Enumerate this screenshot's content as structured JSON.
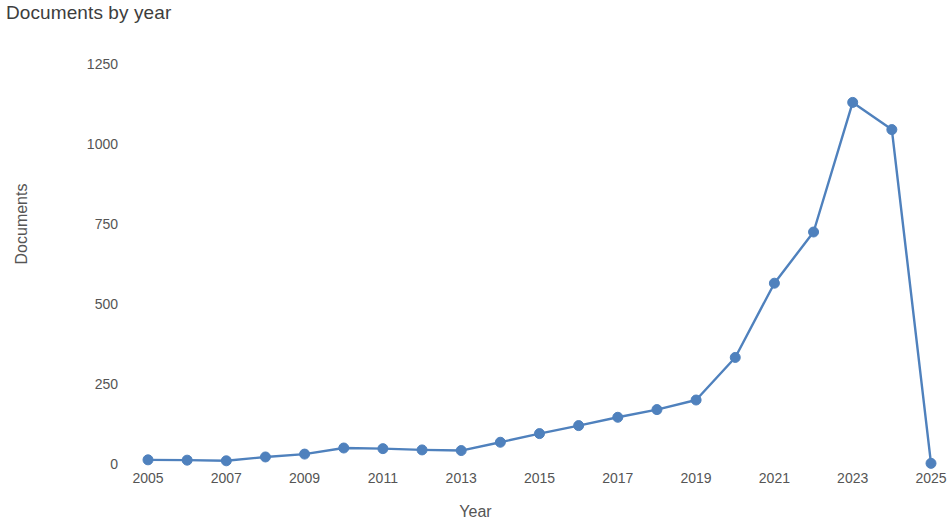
{
  "chart_data": {
    "type": "line",
    "title": "Documents by year",
    "xlabel": "Year",
    "ylabel": "Documents",
    "x": [
      2005,
      2006,
      2007,
      2008,
      2009,
      2010,
      2011,
      2012,
      2013,
      2014,
      2015,
      2016,
      2017,
      2018,
      2019,
      2020,
      2021,
      2022,
      2023,
      2024,
      2025
    ],
    "values": [
      13,
      12,
      10,
      22,
      31,
      50,
      48,
      44,
      42,
      68,
      95,
      120,
      146,
      170,
      200,
      333,
      565,
      725,
      1130,
      1045,
      2
    ],
    "series": [
      {
        "name": "Documents",
        "values": [
          13,
          12,
          10,
          22,
          31,
          50,
          48,
          44,
          42,
          68,
          95,
          120,
          146,
          170,
          200,
          333,
          565,
          725,
          1130,
          1045,
          2
        ],
        "color": "#4f81bd"
      }
    ],
    "xlim": [
      2005,
      2025
    ],
    "ylim": [
      0,
      1250
    ],
    "x_tick_labels": [
      "2005",
      "2007",
      "2009",
      "2011",
      "2013",
      "2015",
      "2017",
      "2019",
      "2021",
      "2023",
      "2025"
    ],
    "x_tick_values": [
      2005,
      2007,
      2009,
      2011,
      2013,
      2015,
      2017,
      2019,
      2021,
      2023,
      2025
    ],
    "y_tick_labels": [
      "0",
      "250",
      "500",
      "750",
      "1000",
      "1250"
    ],
    "y_tick_values": [
      0,
      250,
      500,
      750,
      1000,
      1250
    ],
    "grid": false,
    "legend": "none",
    "marker": "circle",
    "line_color": "#4f81bd",
    "marker_color": "#4f81bd"
  },
  "layout": {
    "plot_left": 148,
    "plot_right": 931,
    "plot_top": 64,
    "plot_bottom": 464
  }
}
